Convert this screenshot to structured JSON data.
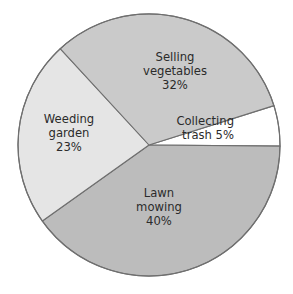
{
  "chart_data": {
    "type": "pie",
    "title": "",
    "subtitle": "",
    "xlabel": "",
    "ylabel": "",
    "legend_position": "none",
    "grid": false,
    "labels_inside": true,
    "unit": "%",
    "categories": [
      "Lawn mowing",
      "Selling vegetables",
      "Weeding garden",
      "Collecting trash"
    ],
    "values": [
      40,
      32,
      23,
      5
    ],
    "slices": [
      {
        "id": "collecting-trash",
        "name": "Collecting trash",
        "value": 5,
        "value_text": "5%",
        "color": "#ffffff",
        "label_lines": [
          "Collecting",
          "trash 5%"
        ],
        "start_angle": -17.5,
        "end_angle": 0.5,
        "label_x": 234,
        "label_y": 128,
        "label_anchor": "end"
      },
      {
        "id": "lawn-mowing",
        "name": "Lawn mowing",
        "value": 40,
        "value_text": "40%",
        "color": "#bcbcbc",
        "label_lines": [
          "Lawn",
          "mowing",
          "40%"
        ],
        "start_angle": 0.5,
        "end_angle": 144.5,
        "label_x": 159,
        "label_y": 207,
        "label_anchor": "middle"
      },
      {
        "id": "weeding-garden",
        "name": "Weeding garden",
        "value": 23,
        "value_text": "23%",
        "color": "#e5e5e5",
        "label_lines": [
          "Weeding",
          "garden",
          "23%"
        ],
        "start_angle": 144.5,
        "end_angle": 227.3,
        "label_x": 69,
        "label_y": 133,
        "label_anchor": "middle"
      },
      {
        "id": "selling-vegetables",
        "name": "Selling vegetables",
        "value": 32,
        "value_text": "32%",
        "color": "#cacaca",
        "label_lines": [
          "Selling",
          "vegetables",
          "32%"
        ],
        "start_angle": 227.3,
        "end_angle": 342.5,
        "label_x": 175,
        "label_y": 71,
        "label_anchor": "middle"
      }
    ],
    "geometry": {
      "center_x": 149,
      "center_y": 145,
      "radius": 131
    },
    "style": {
      "background": "#ffffff",
      "outline_color": "#6f6f6f",
      "label_color": "#2b2b2b"
    }
  }
}
